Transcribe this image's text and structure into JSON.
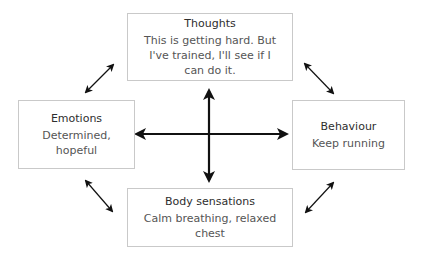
{
  "diagram": {
    "type": "cbt-cycle",
    "boxes": {
      "thoughts": {
        "title": "Thoughts",
        "text": "This is getting hard. But I've trained, I'll see if I can do it."
      },
      "emotions": {
        "title": "Emotions",
        "text": "Determined, hopeful"
      },
      "behaviour": {
        "title": "Behaviour",
        "text": "Keep running"
      },
      "body": {
        "title": "Body sensations",
        "text": "Calm breathing, relaxed chest"
      }
    },
    "connections": [
      {
        "from": "thoughts",
        "to": "emotions",
        "style": "double-arrow"
      },
      {
        "from": "thoughts",
        "to": "behaviour",
        "style": "double-arrow"
      },
      {
        "from": "emotions",
        "to": "body",
        "style": "double-arrow"
      },
      {
        "from": "behaviour",
        "to": "body",
        "style": "double-arrow"
      },
      {
        "from": "emotions",
        "to": "behaviour",
        "style": "double-arrow-bold"
      },
      {
        "from": "thoughts",
        "to": "body",
        "style": "double-arrow-bold"
      }
    ],
    "colors": {
      "border": "#c9c9c9",
      "arrow": "#111111",
      "text": "#3a3a3a"
    }
  }
}
